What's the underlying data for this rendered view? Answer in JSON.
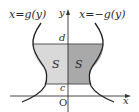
{
  "diagram": {
    "type": "area-between-curves",
    "labels": {
      "left_curve": "x=g(y)",
      "right_curve": "x=−g(y)",
      "y_axis": "y",
      "x_axis": "x",
      "origin": "O",
      "upper_bound": "d",
      "lower_bound": "c",
      "left_region": "S",
      "right_region": "S"
    },
    "colors": {
      "left_region_fill": "#d9d9d9",
      "right_region_fill": "#a9a9a9",
      "curve": "#222222",
      "axis": "#333333",
      "bound_line": "#555555",
      "background": "#ffffff"
    }
  }
}
